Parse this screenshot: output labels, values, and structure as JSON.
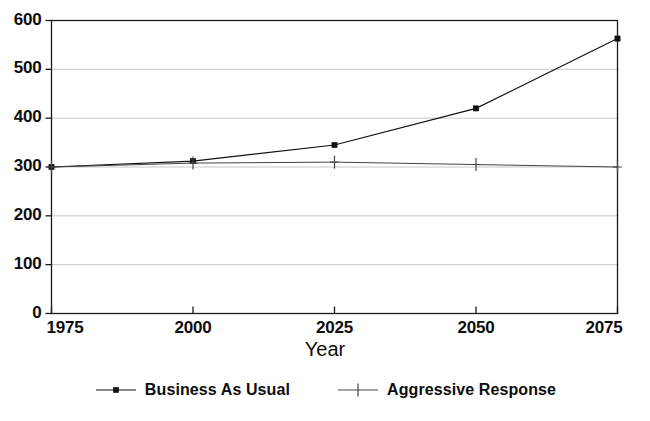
{
  "chart_data": {
    "type": "line",
    "title": "",
    "xlabel": "Year",
    "ylabel": "",
    "xlim": [
      1975,
      2075
    ],
    "ylim": [
      0,
      600
    ],
    "grid": true,
    "legend_position": "bottom",
    "x": [
      1975,
      2000,
      2025,
      2050,
      2075
    ],
    "xticks": [
      "1975",
      "2000",
      "2025",
      "2050",
      "2075"
    ],
    "yticks": [
      "0",
      "100",
      "200",
      "300",
      "400",
      "500",
      "600"
    ],
    "ytick_values": [
      0,
      100,
      200,
      300,
      400,
      500,
      600
    ],
    "series": [
      {
        "name": "Business As Usual",
        "marker": "square",
        "color": "#111111",
        "values": [
          300,
          312,
          345,
          420,
          563
        ]
      },
      {
        "name": "Aggressive Response",
        "marker": "plus",
        "color": "#444444",
        "values": [
          300,
          308,
          310,
          305,
          300
        ]
      }
    ]
  },
  "axis": {
    "x_title": "Year"
  },
  "ticks": {
    "y": [
      {
        "label": "600"
      },
      {
        "label": "500"
      },
      {
        "label": "400"
      },
      {
        "label": "300"
      },
      {
        "label": "200"
      },
      {
        "label": "100"
      },
      {
        "label": "0"
      }
    ],
    "x": [
      {
        "label": "1975"
      },
      {
        "label": "2000"
      },
      {
        "label": "2025"
      },
      {
        "label": "2050"
      },
      {
        "label": "2075"
      }
    ]
  },
  "legend": {
    "entries": [
      {
        "label": "Business As Usual",
        "marker": "square-marker"
      },
      {
        "label": "Aggressive Response",
        "marker": "plus-marker"
      }
    ]
  }
}
